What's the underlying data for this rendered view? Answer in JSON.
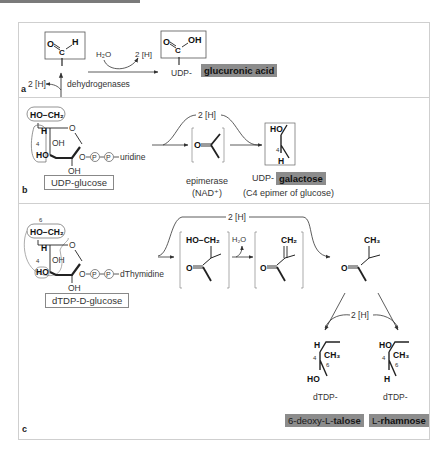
{
  "figure": {
    "panels": [
      {
        "letter": "a",
        "reactant_group": {
          "o": "O",
          "c": "C",
          "h": "H"
        },
        "cofactor_left": "2 [H]",
        "enzyme": "dehydrogenases",
        "water": "H₂O",
        "cofactor_right": "2 [H]",
        "product_group": {
          "o": "O",
          "c": "C",
          "oh": "OH"
        },
        "product_prefix": "UDP-",
        "product_name": "glucuronic acid"
      },
      {
        "letter": "b",
        "substrate": {
          "ch2oh": "HO−CH₂",
          "h": "H",
          "c4": "4",
          "oh3": "OH",
          "ho4": "HO",
          "ring_o": "O",
          "oh2": "OH",
          "link": "O",
          "p1": "P",
          "p2": "P",
          "nucleoside": "uridine",
          "name": "UDP-glucose"
        },
        "cofactor": "2 [H]",
        "intermediate_o": "O",
        "enzyme": "epimerase",
        "enzyme_cofactor": "(NAD⁺)",
        "product_group": {
          "ho": "HO",
          "c4": "4",
          "h": "H"
        },
        "product_prefix": "UDP-",
        "product_name": "galactose",
        "product_note": "(C4 epimer of glucose)"
      },
      {
        "letter": "c",
        "substrate": {
          "c6": "6",
          "ch2oh": "HO−CH₂",
          "h": "H",
          "c4": "4",
          "oh3": "OH",
          "ho4": "HO",
          "ring_o": "O",
          "oh2": "OH",
          "link": "O",
          "p1": "P",
          "p2": "P",
          "nucleoside": "dThymidine",
          "name": "dTDP-D-glucose"
        },
        "cofactor_top": "2 [H]",
        "intermediate1": {
          "top": "HO−CH₂",
          "o": "O"
        },
        "water": "H₂O",
        "intermediate2": {
          "top": "CH₂",
          "o": "O"
        },
        "intermediate3": {
          "top": "CH₃",
          "o": "O"
        },
        "cofactor_bottom": "2 [H]",
        "products": [
          {
            "top_sub": "H",
            "c4": "4",
            "ch3": "CH₃",
            "c6": "6",
            "bottom_sub": "HO",
            "prefix": "dTDP-",
            "name_plain": "6-deoxy-",
            "name_stereo": "L-",
            "name_bold": "talose"
          },
          {
            "top_sub": "HO",
            "c4": "4",
            "ch3": "CH₃",
            "c6": "6",
            "bottom_sub": "H",
            "prefix": "dTDP-",
            "name_plain": "",
            "name_stereo": "L-",
            "name_bold": "rhamnose"
          }
        ]
      }
    ],
    "colors": {
      "frame": "#cfcfcf",
      "highlight": "#8c8c8c",
      "text": "#333333"
    }
  }
}
